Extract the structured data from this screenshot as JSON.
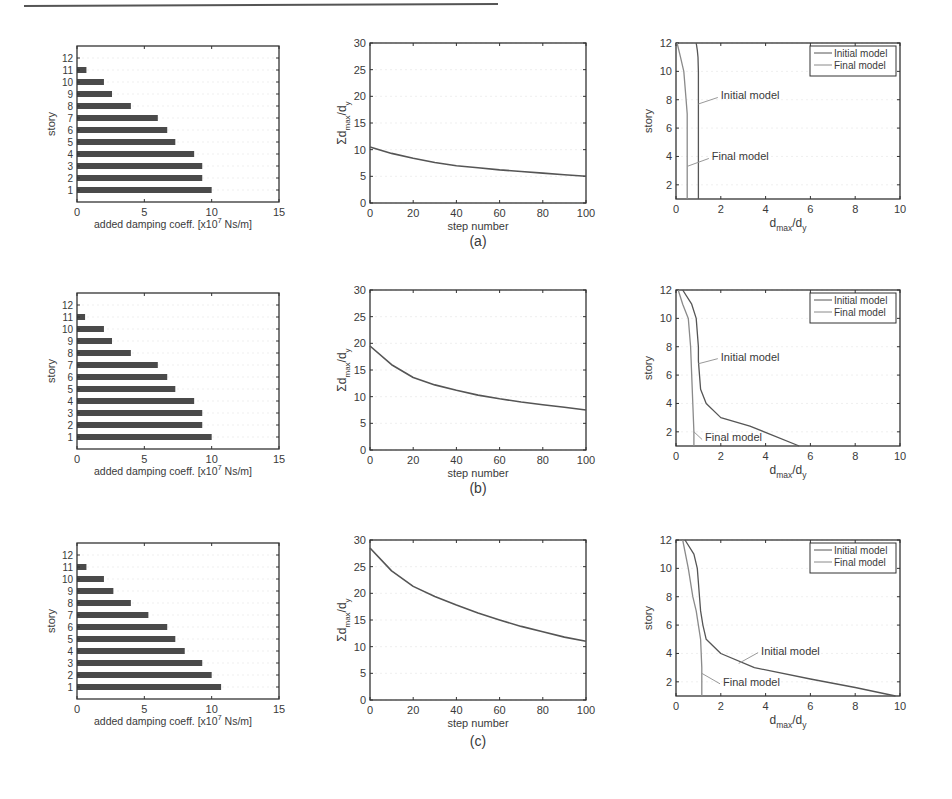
{
  "figure": {
    "rule_color": "#555555",
    "axis_color": "#333333",
    "bar_color": "#4a4a4a",
    "line_color": "#555555",
    "final_line_color": "#8a8a8a"
  },
  "chart_data": [
    {
      "panel": "a-left",
      "row_caption": "(a)",
      "type": "bar",
      "orientation": "horizontal",
      "categories": [
        "1",
        "2",
        "3",
        "4",
        "5",
        "6",
        "7",
        "8",
        "9",
        "10",
        "11",
        "12"
      ],
      "values": [
        10.0,
        9.3,
        9.3,
        8.7,
        7.3,
        6.7,
        6.0,
        4.0,
        2.6,
        2.0,
        0.7,
        0
      ],
      "xlabel": "added damping coeff. [x10^7 Ns/m]",
      "ylabel": "story",
      "xlim": [
        0,
        15
      ],
      "xticks": [
        0,
        5,
        10,
        15
      ],
      "ylim": [
        0,
        13
      ],
      "yticks": [
        1,
        2,
        3,
        4,
        5,
        6,
        7,
        8,
        9,
        10,
        11,
        12
      ],
      "grid": false
    },
    {
      "panel": "a-middle",
      "type": "line",
      "x": [
        0,
        10,
        20,
        30,
        40,
        50,
        60,
        70,
        80,
        90,
        100
      ],
      "series": [
        {
          "name": "sum dmax/dy",
          "values": [
            10.5,
            9.3,
            8.4,
            7.6,
            7.0,
            6.6,
            6.2,
            5.9,
            5.6,
            5.3,
            5.0
          ]
        }
      ],
      "xlabel": "step number",
      "ylabel": "Σd_max/d_y",
      "xlim": [
        0,
        100
      ],
      "xticks": [
        0,
        20,
        40,
        60,
        80,
        100
      ],
      "ylim": [
        0,
        30
      ],
      "yticks": [
        0,
        5,
        10,
        15,
        20,
        25,
        30
      ],
      "grid": false
    },
    {
      "panel": "a-right",
      "type": "line",
      "xlabel": "d_max/d_y",
      "ylabel": "story",
      "xlim": [
        0,
        10
      ],
      "xticks": [
        0,
        2,
        4,
        6,
        8,
        10
      ],
      "ylim": [
        1,
        12
      ],
      "yticks": [
        2,
        4,
        6,
        8,
        10,
        12
      ],
      "legend": {
        "position": "upper right",
        "entries": [
          "Initial model",
          "Final model"
        ]
      },
      "series": [
        {
          "name": "Initial model",
          "x": [
            0.9,
            0.95,
            0.98,
            1.0,
            1.0,
            1.0,
            1.0,
            1.0,
            1.0,
            1.0,
            1.0,
            1.0
          ],
          "y": [
            12,
            11.5,
            11,
            10,
            9,
            8,
            7,
            6,
            5,
            4,
            2,
            1
          ]
        },
        {
          "name": "Final model",
          "x": [
            0.05,
            0.2,
            0.35,
            0.45,
            0.5,
            0.5,
            0.5,
            0.5,
            0.5,
            0.5
          ],
          "y": [
            12,
            11,
            10,
            8,
            7,
            6,
            5,
            4,
            2,
            1
          ]
        }
      ],
      "annotations": [
        {
          "text": "Initial model",
          "x": 2.0,
          "y": 8.3,
          "arrow_to": [
            1.0,
            7.7
          ]
        },
        {
          "text": "Final model",
          "x": 1.6,
          "y": 4.0,
          "arrow_to": [
            0.5,
            3.3
          ]
        }
      ]
    },
    {
      "panel": "b-left",
      "row_caption": "(b)",
      "type": "bar",
      "orientation": "horizontal",
      "categories": [
        "1",
        "2",
        "3",
        "4",
        "5",
        "6",
        "7",
        "8",
        "9",
        "10",
        "11",
        "12"
      ],
      "values": [
        10.0,
        9.3,
        9.3,
        8.7,
        7.3,
        6.7,
        6.0,
        4.0,
        2.6,
        2.0,
        0.6,
        0
      ],
      "xlabel": "added damping coeff. [x10^7 Ns/m]",
      "ylabel": "story",
      "xlim": [
        0,
        15
      ],
      "xticks": [
        0,
        5,
        10,
        15
      ],
      "ylim": [
        0,
        13
      ],
      "yticks": [
        1,
        2,
        3,
        4,
        5,
        6,
        7,
        8,
        9,
        10,
        11,
        12
      ],
      "grid": false
    },
    {
      "panel": "b-middle",
      "type": "line",
      "x": [
        0,
        10,
        20,
        30,
        40,
        50,
        60,
        70,
        80,
        90,
        100
      ],
      "series": [
        {
          "name": "sum dmax/dy",
          "values": [
            19.5,
            16.0,
            13.6,
            12.2,
            11.2,
            10.3,
            9.6,
            9.0,
            8.5,
            8.0,
            7.5
          ]
        }
      ],
      "xlabel": "step number",
      "ylabel": "Σd_max/d_y",
      "xlim": [
        0,
        100
      ],
      "xticks": [
        0,
        20,
        40,
        60,
        80,
        100
      ],
      "ylim": [
        0,
        30
      ],
      "yticks": [
        0,
        5,
        10,
        15,
        20,
        25,
        30
      ],
      "grid": false
    },
    {
      "panel": "b-right",
      "type": "line",
      "xlabel": "d_max/d_y",
      "ylabel": "story",
      "xlim": [
        0,
        10
      ],
      "xticks": [
        0,
        2,
        4,
        6,
        8,
        10
      ],
      "ylim": [
        1,
        12
      ],
      "yticks": [
        2,
        4,
        6,
        8,
        10,
        12
      ],
      "legend": {
        "position": "upper right",
        "entries": [
          "Initial model",
          "Final model"
        ]
      },
      "series": [
        {
          "name": "Initial model",
          "x": [
            0.3,
            0.7,
            0.9,
            1.0,
            1.0,
            1.05,
            1.1,
            1.35,
            2.0,
            3.3,
            5.5
          ],
          "y": [
            12,
            11,
            10,
            8,
            7,
            6,
            5,
            4,
            3,
            2.4,
            1
          ]
        },
        {
          "name": "Final model",
          "x": [
            0.1,
            0.3,
            0.55,
            0.65,
            0.7,
            0.75,
            0.8,
            0.8
          ],
          "y": [
            12,
            11,
            10,
            8,
            6,
            4,
            2,
            1
          ]
        }
      ],
      "annotations": [
        {
          "text": "Initial model",
          "x": 2.0,
          "y": 7.3,
          "arrow_to": [
            1.0,
            6.8
          ]
        },
        {
          "text": "Final model",
          "x": 1.3,
          "y": 1.6,
          "arrow_to": [
            0.8,
            2.0
          ]
        }
      ]
    },
    {
      "panel": "c-left",
      "row_caption": "(c)",
      "type": "bar",
      "orientation": "horizontal",
      "categories": [
        "1",
        "2",
        "3",
        "4",
        "5",
        "6",
        "7",
        "8",
        "9",
        "10",
        "11",
        "12"
      ],
      "values": [
        10.7,
        10.0,
        9.3,
        8.0,
        7.3,
        6.7,
        5.3,
        4.0,
        2.7,
        2.0,
        0.7,
        0
      ],
      "xlabel": "added damping coeff. [x10^7 Ns/m]",
      "ylabel": "story",
      "xlim": [
        0,
        15
      ],
      "xticks": [
        0,
        5,
        10,
        15
      ],
      "ylim": [
        0,
        13
      ],
      "yticks": [
        1,
        2,
        3,
        4,
        5,
        6,
        7,
        8,
        9,
        10,
        11,
        12
      ],
      "grid": false
    },
    {
      "panel": "c-middle",
      "type": "line",
      "x": [
        0,
        10,
        20,
        30,
        40,
        50,
        60,
        70,
        80,
        90,
        100
      ],
      "series": [
        {
          "name": "sum dmax/dy",
          "values": [
            28.5,
            24.2,
            21.3,
            19.4,
            17.8,
            16.3,
            15.0,
            13.8,
            12.8,
            11.8,
            11.0
          ]
        }
      ],
      "xlabel": "step number",
      "ylabel": "Σd_max/d_y",
      "xlim": [
        0,
        100
      ],
      "xticks": [
        0,
        20,
        40,
        60,
        80,
        100
      ],
      "ylim": [
        0,
        30
      ],
      "yticks": [
        0,
        5,
        10,
        15,
        20,
        25,
        30
      ],
      "grid": false
    },
    {
      "panel": "c-right",
      "type": "line",
      "xlabel": "d_max/d_y",
      "ylabel": "story",
      "xlim": [
        0,
        10
      ],
      "xticks": [
        0,
        2,
        4,
        6,
        8,
        10
      ],
      "ylim": [
        1,
        12
      ],
      "yticks": [
        2,
        4,
        6,
        8,
        10,
        12
      ],
      "legend": {
        "position": "upper right",
        "entries": [
          "Initial model",
          "Final model"
        ]
      },
      "series": [
        {
          "name": "Initial model",
          "x": [
            0.4,
            0.8,
            0.95,
            1.05,
            1.1,
            1.2,
            1.35,
            2.0,
            3.5,
            6.0,
            8.0,
            9.8
          ],
          "y": [
            12,
            11,
            10,
            8,
            7,
            6,
            5,
            4,
            3,
            2.2,
            1.6,
            1
          ]
        },
        {
          "name": "Final model",
          "x": [
            0.3,
            0.55,
            0.75,
            0.9,
            1.0,
            1.1,
            1.15,
            1.15
          ],
          "y": [
            12,
            10,
            8,
            7,
            6,
            5,
            3,
            1
          ]
        }
      ],
      "annotations": [
        {
          "text": "Initial model",
          "x": 3.8,
          "y": 4.2,
          "arrow_to": [
            2.8,
            3.3
          ]
        },
        {
          "text": "Final model",
          "x": 2.1,
          "y": 2.0,
          "arrow_to": [
            1.15,
            2.6
          ]
        }
      ]
    }
  ],
  "captions": [
    "(a)",
    "(b)",
    "(c)"
  ],
  "labels": {
    "bar_xlabel_main": "added damping coeff. [x10",
    "bar_xlabel_exp": "7",
    "bar_xlabel_tail": " Ns/m]",
    "story": "story",
    "step_number": "step number",
    "sum_label_sigma": "Σd",
    "sum_label_max": "max",
    "sum_label_slash": "/d",
    "sum_label_y": "y",
    "ratio_d": "d",
    "ratio_max": "max",
    "ratio_slash": "/d",
    "ratio_y": "y"
  }
}
